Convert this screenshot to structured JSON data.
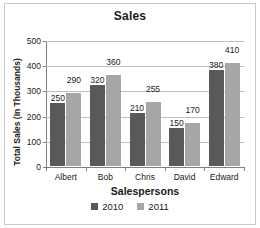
{
  "chart_data": {
    "type": "bar",
    "title": "Sales",
    "xlabel": "Salespersons",
    "ylabel": "Total Sales (In Thousands)",
    "categories": [
      "Albert",
      "Bob",
      "Chris",
      "David",
      "Edward"
    ],
    "series": [
      {
        "name": "2010",
        "color": "#595959",
        "values": [
          250,
          320,
          210,
          150,
          380
        ]
      },
      {
        "name": "2011",
        "color": "#a6a6a6",
        "values": [
          290,
          360,
          255,
          170,
          410
        ]
      }
    ],
    "ylim": [
      0,
      500
    ],
    "yticks": [
      0,
      100,
      200,
      300,
      400,
      500
    ],
    "ytick_labels": [
      "0",
      "100",
      "200",
      "300",
      "400",
      "500"
    ],
    "grid": "horizontal",
    "legend_position": "bottom",
    "data_labels": true
  },
  "legend": {
    "items": [
      {
        "label": "2010",
        "color": "#595959"
      },
      {
        "label": "2011",
        "color": "#a6a6a6"
      }
    ]
  },
  "colors": {
    "series_2010": "#595959",
    "series_2011": "#a6a6a6",
    "gridline": "#bfbfbf",
    "axis": "#808080",
    "frame": "#c8c8c8",
    "text": "#1a1a1a"
  }
}
